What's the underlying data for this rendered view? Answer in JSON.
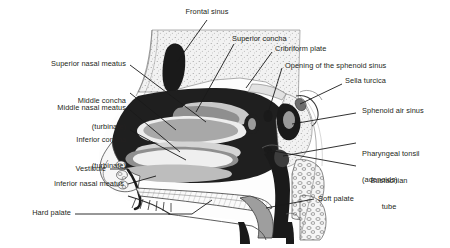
{
  "figure": {
    "background_color": "#ffffff",
    "text_color": "#231f20",
    "line_color": "#1a1a1a",
    "width": 450,
    "height": 248
  },
  "labels": {
    "frontal_sinus": "Frontal sinus",
    "superior_concha": "Superior concha",
    "cribriform_plate": "Cribriform plate",
    "opening_sphenoid_sinus": "Opening of the sphenoid sinus",
    "sella_turcica": "Sella turcica",
    "sphenoid_air_sinus": "Sphenoid air sinus",
    "pharyngeal_tonsil_l1": "Pharyngeal tonsil",
    "pharyngeal_tonsil_l2": "(adenoids)",
    "eustachian_l1": "Eustachian",
    "eustachian_l2": "tube",
    "soft_palate": "Soft palate",
    "hard_palate": "Hard palate",
    "inferior_nasal_meatus": "Inferior nasal meatus",
    "vestibule": "Vestibule",
    "inferior_concha_l1": "Inferior concha",
    "inferior_concha_l2": "(turbinate)",
    "middle_nasal_meatus": "Middle nasal meatus",
    "middle_concha_l1": "Middle concha",
    "middle_concha_l2": "(turbinate)",
    "superior_nasal_meatus": "Superior nasal meatus"
  },
  "palette": {
    "black": "#1a1a1a",
    "dark_gray": "#4d4d4d",
    "mid_gray": "#808080",
    "light_gray": "#b3b3b3",
    "pale_gray": "#d9d9d9",
    "bone_stipple": "#efefef",
    "white": "#ffffff"
  }
}
